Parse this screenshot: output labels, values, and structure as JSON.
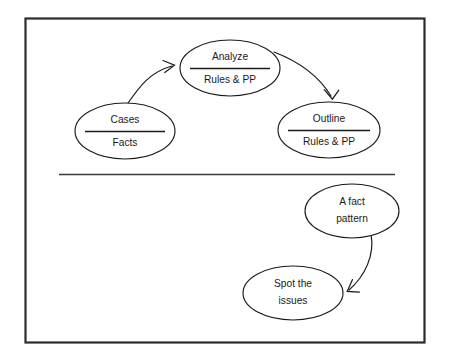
{
  "diagram": {
    "frame": {
      "stroke_color": "#2b2b2b"
    },
    "section_divider": {
      "name": "horizontal-divider"
    },
    "nodes": [
      {
        "id": "cases-facts",
        "name": "node-cases-facts",
        "top_label": "Cases",
        "bottom_label": "Facts",
        "cx": 125,
        "cy": 131,
        "rx": 50,
        "ry": 28,
        "has_rule": true,
        "rule_half_width": 40
      },
      {
        "id": "analyze",
        "name": "node-analyze",
        "top_label": "Analyze",
        "bottom_label": "Rules & PP",
        "cx": 230,
        "cy": 68,
        "rx": 50,
        "ry": 28,
        "has_rule": true,
        "rule_half_width": 40
      },
      {
        "id": "outline",
        "name": "node-outline",
        "top_label": "Outline",
        "bottom_label": "Rules & PP",
        "cx": 329,
        "cy": 130,
        "rx": 51,
        "ry": 28,
        "has_rule": true,
        "rule_half_width": 41
      },
      {
        "id": "fact-pattern",
        "name": "node-a-fact-pattern",
        "top_label": "A fact",
        "bottom_label": "pattern",
        "cx": 352,
        "cy": 211,
        "rx": 47,
        "ry": 27,
        "has_rule": false,
        "rule_half_width": 0
      },
      {
        "id": "spot-issues",
        "name": "node-spot-the-issues",
        "top_label": "Spot the",
        "bottom_label": "issues",
        "cx": 293,
        "cy": 293,
        "rx": 50,
        "ry": 27,
        "has_rule": false,
        "rule_half_width": 0
      }
    ],
    "arrows": [
      {
        "id": "cases-to-analyze",
        "name": "arrow-cases-to-analyze",
        "from": "cases-facts",
        "to": "analyze"
      },
      {
        "id": "analyze-to-outline",
        "name": "arrow-analyze-to-outline",
        "from": "analyze",
        "to": "outline"
      },
      {
        "id": "fact-to-spot",
        "name": "arrow-fact-pattern-to-spot-issues",
        "from": "fact-pattern",
        "to": "spot-issues"
      }
    ]
  }
}
